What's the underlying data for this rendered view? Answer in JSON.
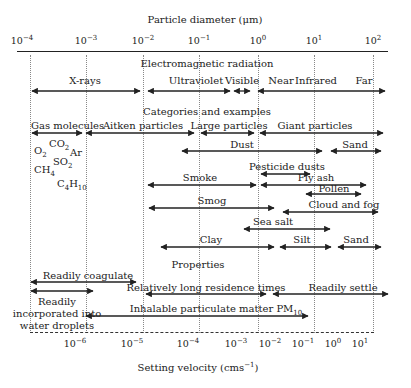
{
  "top_axis": {
    "title": "Particle diameter (μm)",
    "ticks": [
      {
        "base": "10",
        "exp": "−4",
        "x": 17
      },
      {
        "base": "10",
        "exp": "−3",
        "x": 86
      },
      {
        "base": "10",
        "exp": "−2",
        "x": 143
      },
      {
        "base": "10",
        "exp": "−1",
        "x": 199
      },
      {
        "base": "10",
        "exp": "0",
        "x": 258
      },
      {
        "base": "10",
        "exp": "1",
        "x": 314
      },
      {
        "base": "10",
        "exp": "2",
        "x": 373
      }
    ]
  },
  "sections": {
    "em": "Electromagnetic radiation",
    "categories": "Categories and examples",
    "properties": "Properties"
  },
  "em_bands": {
    "xrays": "X-rays",
    "uv": "Ultraviolet",
    "visible": "Visible",
    "near": "Near",
    "infrared": "Infrared",
    "far": "Far"
  },
  "categories": {
    "gas": "Gas molecules",
    "aitken": "Aitken particles",
    "large": "Large particles",
    "giant": "Giant particles",
    "dust": "Dust",
    "sand1": "Sand",
    "pesticide": "Pesticide dusts",
    "smoke": "Smoke",
    "flyash": "Fly ash",
    "pollen": "Pollen",
    "smog": "Smog",
    "cloud": "Cloud and fog",
    "seasalt": "Sea salt",
    "clay": "Clay",
    "silt": "Silt",
    "sand2": "Sand"
  },
  "gases": {
    "o2": {
      "base": "O",
      "sub": "2"
    },
    "co2": {
      "base": "CO",
      "sub": "2"
    },
    "ar": "Ar",
    "so2": {
      "base": "SO",
      "sub": "2"
    },
    "ch4": {
      "base": "CH",
      "sub": "4"
    },
    "c4h10": {
      "base1": "C",
      "sub1": "4",
      "base2": "H",
      "sub2": "10"
    }
  },
  "properties": {
    "coagulate": "Readily coagulate",
    "residence": "Relatively long residence times",
    "settle": "Readily settle",
    "incorporated_1": "Readily",
    "incorporated_2": "incorporated into",
    "incorporated_3": "water droplets",
    "pm10": "Inhalable particulate matter PM",
    "pm10_sub": "10"
  },
  "bottom_axis": {
    "title": "Setting velocity (cms",
    "title_exp": "−1",
    "title_end": ")",
    "ticks": [
      {
        "base": "10",
        "exp": "−6",
        "x": 75
      },
      {
        "base": "10",
        "exp": "−5",
        "x": 132
      },
      {
        "base": "10",
        "exp": "−4",
        "x": 188
      },
      {
        "base": "10",
        "exp": "−3",
        "x": 236
      },
      {
        "base": "10",
        "exp": "−2",
        "x": 270
      },
      {
        "base": "10",
        "exp": "−1",
        "x": 303
      },
      {
        "base": "10",
        "exp": "0",
        "x": 333
      },
      {
        "base": "10",
        "exp": "1",
        "x": 360
      }
    ]
  }
}
